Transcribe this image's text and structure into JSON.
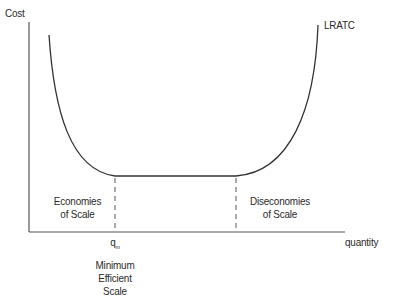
{
  "diagram": {
    "y_axis_label": "Cost",
    "x_axis_label": "quantity",
    "curve_label": "LRATC",
    "regions": {
      "left": [
        "Economies",
        "of Scale"
      ],
      "right": [
        "Diseconomies",
        "of Scale"
      ]
    },
    "marker": {
      "symbol": "q",
      "subscript": "m",
      "caption": [
        "Minimum",
        "Efficient",
        "Scale"
      ]
    },
    "colors": {
      "line": "#333333",
      "axis": "#555555",
      "dash": "#555555"
    }
  }
}
